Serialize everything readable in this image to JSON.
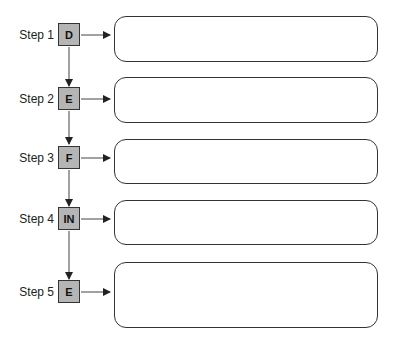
{
  "diagram": {
    "colors": {
      "step_box_fill": "#b5b5b5",
      "stroke": "#333333",
      "background": "#ffffff"
    },
    "steps": [
      {
        "label": "Step 1",
        "letter": "D",
        "answer": ""
      },
      {
        "label": "Step 2",
        "letter": "E",
        "answer": ""
      },
      {
        "label": "Step 3",
        "letter": "F",
        "answer": ""
      },
      {
        "label": "Step 4",
        "letter": "IN",
        "answer": ""
      },
      {
        "label": "Step 5",
        "letter": "E",
        "answer": ""
      }
    ]
  }
}
